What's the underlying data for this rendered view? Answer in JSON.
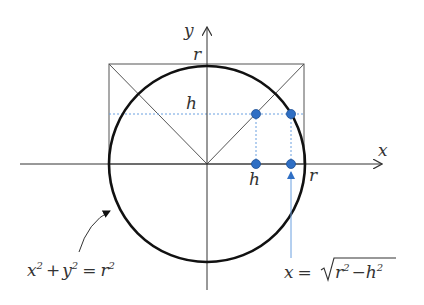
{
  "labels": {
    "y_axis": "y",
    "x_axis": "x",
    "r_top": "r",
    "r_right": "r",
    "h_left": "h",
    "h_bottom": "h",
    "circle_eq": {
      "x": "x",
      "y": "y",
      "plus": "+",
      "eq": "=",
      "r": "r",
      "exp": "2"
    },
    "root_eq": {
      "x": "x",
      "eq": "=",
      "r": "r",
      "minus": "−",
      "h": "h",
      "exp": "2"
    }
  },
  "geometry": {
    "origin": [
      207,
      164
    ],
    "radius": 98,
    "h": 48,
    "sqrt_x": 84
  },
  "colors": {
    "circle": "#111111",
    "axes": "#333333",
    "dots": "#2f6fc4",
    "dashed": "#6aa0e0",
    "arrow_blue": "#6aa0e0"
  }
}
